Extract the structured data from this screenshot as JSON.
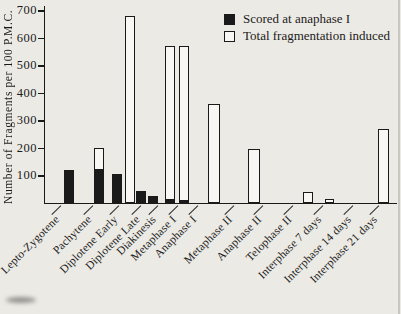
{
  "figure": {
    "ylabel": "Number of Fragments per 100 P.M.C.",
    "legend": {
      "scored_label": "Scored at anaphase I",
      "total_label": "Total fragmentation induced"
    },
    "ink_color": "#1a1a1a",
    "paper_color": "#eceae5"
  },
  "chart_data": {
    "type": "bar",
    "title": "",
    "xlabel": "",
    "ylabel": "Number of Fragments per 100 P.M.C.",
    "ylim": [
      0,
      700
    ],
    "yticks": [
      100,
      200,
      300,
      400,
      500,
      600,
      700
    ],
    "grid": false,
    "legend_position": "top-right",
    "legend": [
      "Scored at anaphase I",
      "Total fragmentation induced"
    ],
    "categories": [
      "Lepto-Zygotene",
      "Pachytene",
      "Diplotene Early",
      "Diplotene Late",
      "Diakinesis",
      "Metaphase I",
      "Anaphase I",
      "Metaphase II",
      "Anaphase II",
      "Telophase II",
      "Interphase 7 days",
      "Interphase 14 days",
      "Interphase 21 days"
    ],
    "series": [
      {
        "name": "Scored at anaphase I",
        "style": "solid-black",
        "values": [
          120,
          125,
          105,
          45,
          25,
          15,
          10,
          0,
          0,
          0,
          0,
          0,
          0
        ]
      },
      {
        "name": "Total fragmentation induced",
        "style": "open-outline",
        "values": [
          120,
          200,
          105,
          680,
          25,
          570,
          570,
          360,
          195,
          40,
          15,
          0,
          270
        ]
      }
    ],
    "bars": [
      {
        "label": "Lepto-Zygotene",
        "tick_x": 60,
        "x": 64,
        "w": 10,
        "total": 120,
        "scored": 120,
        "style": "black"
      },
      {
        "label": "Pachytene",
        "tick_x": 92,
        "x": 94,
        "w": 10,
        "total": 200,
        "scored": 125,
        "style": "overlay"
      },
      {
        "label": "Diplotene Early",
        "tick_x": 118,
        "x": 112,
        "w": 10,
        "total": 105,
        "scored": 105,
        "style": "black"
      },
      {
        "label": "Diplotene Late",
        "tick_x": 140,
        "x": 125,
        "w": 10,
        "total": 680,
        "scored": 45,
        "style": "pair"
      },
      {
        "label": "Diakinesis",
        "tick_x": 157,
        "x": 148,
        "w": 10,
        "total": 25,
        "scored": 25,
        "style": "black"
      },
      {
        "label": "Metaphase I",
        "tick_x": 177,
        "x": 165,
        "w": 10,
        "total": 570,
        "scored": 15,
        "style": "overlay"
      },
      {
        "label": "Anaphase I",
        "tick_x": 197,
        "x": 179,
        "w": 10,
        "total": 570,
        "scored": 10,
        "style": "overlay"
      },
      {
        "label": "Metaphase II",
        "tick_x": 233,
        "x": 208,
        "w": 12,
        "total": 360,
        "scored": 0,
        "style": "open"
      },
      {
        "label": "Anaphase II",
        "tick_x": 262,
        "x": 248,
        "w": 12,
        "total": 195,
        "scored": 0,
        "style": "open"
      },
      {
        "label": "Telophase II",
        "tick_x": 292,
        "x": 303,
        "w": 10,
        "total": 40,
        "scored": 0,
        "style": "open"
      },
      {
        "label": "Interphase 7 days",
        "tick_x": 322,
        "x": 325,
        "w": 9,
        "total": 15,
        "scored": 0,
        "style": "open"
      },
      {
        "label": "Interphase 14 days",
        "tick_x": 352,
        "x": null,
        "w": 0,
        "total": 0,
        "scored": 0,
        "style": "none"
      },
      {
        "label": "Interphase 21 days",
        "tick_x": 378,
        "x": 378,
        "w": 11,
        "total": 270,
        "scored": 0,
        "style": "open"
      }
    ],
    "layout": {
      "baseline_y": 203,
      "plot_top_y": 10,
      "axis_x": 44,
      "axis_right_x": 397
    }
  }
}
